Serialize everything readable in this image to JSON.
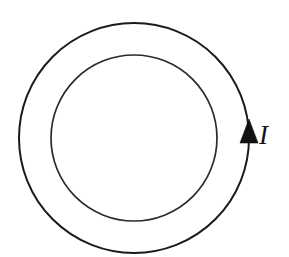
{
  "figure": {
    "background_color": "#ffffff",
    "stroke_color": "#1b1b1b",
    "width": 289,
    "height": 257
  },
  "geometry": {
    "center_x": 134,
    "center_y": 138,
    "outer_radius": 115,
    "inner_radius": 83
  },
  "labels": {
    "current": "I"
  },
  "arrow": {
    "name": "current-direction-arrow",
    "direction": "up",
    "position_x": 248,
    "position_y": 137,
    "color": "#111111"
  },
  "chart_data": {
    "type": "diagram",
    "shapes": [
      {
        "name": "outer-circle",
        "type": "circle",
        "cx": 134,
        "cy": 138,
        "r": 115,
        "stroke": "#1b1b1b",
        "fill": "none"
      },
      {
        "name": "inner-circle",
        "type": "circle",
        "cx": 134,
        "cy": 138,
        "r": 83,
        "stroke": "#2a2a2a",
        "fill": "none"
      },
      {
        "name": "arrowhead",
        "type": "triangle",
        "cx": 248,
        "cy": 137,
        "pointing": "up",
        "fill": "#111111"
      }
    ],
    "annotations": [
      {
        "text": "I",
        "x": 268,
        "y": 137,
        "style": "italic-serif",
        "meaning": "current"
      }
    ],
    "legend": [],
    "grid": false
  }
}
